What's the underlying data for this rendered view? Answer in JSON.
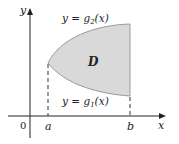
{
  "diagram": {
    "type": "type I region between two curves",
    "region_label": "D",
    "upper_curve_label": "y = g",
    "upper_curve_sub": "2",
    "upper_curve_tail": "(x)",
    "lower_curve_label": "y = g",
    "lower_curve_sub": "1",
    "lower_curve_tail": "(x)",
    "x_axis_label": "x",
    "y_axis_label": "y",
    "origin_label": "0",
    "a_label": "a",
    "b_label": "b",
    "colors": {
      "region_fill": "#d9d9d9",
      "region_stroke": "#9a9a9a",
      "axis": "#222222",
      "dashed": "#555555"
    }
  }
}
